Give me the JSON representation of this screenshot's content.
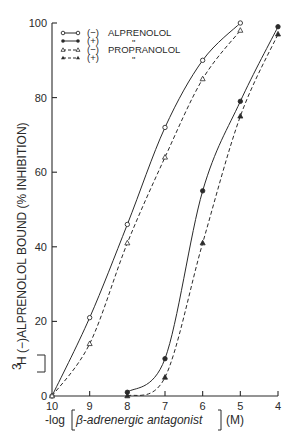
{
  "chart_data": {
    "type": "line",
    "title": "",
    "xlabel": "-log[β-adrenergic antagonist] (M)",
    "ylabel": "[3H](-)ALPRENOLOL BOUND (% INHIBITION)",
    "x_ticks": [
      10,
      9,
      8,
      7,
      6,
      5,
      4
    ],
    "y_ticks": [
      0,
      20,
      40,
      60,
      80,
      100
    ],
    "xlim": [
      10,
      4
    ],
    "ylim": [
      0,
      100
    ],
    "grid": false,
    "legend_position": "top-left",
    "series": [
      {
        "name": "(-) ALPRENOLOL",
        "marker": "open-circle",
        "line": "solid",
        "x": [
          10,
          9,
          8,
          7,
          6,
          5
        ],
        "y": [
          0,
          21,
          46,
          72,
          90,
          100
        ]
      },
      {
        "name": "(+) ALPRENOLOL",
        "marker": "filled-circle",
        "line": "solid",
        "x": [
          8,
          7,
          6,
          5,
          4
        ],
        "y": [
          1,
          10,
          55,
          79,
          99
        ]
      },
      {
        "name": "(-) PROPRANOLOL",
        "marker": "open-triangle",
        "line": "dashed",
        "x": [
          10,
          9,
          8,
          7,
          6,
          5
        ],
        "y": [
          0,
          14,
          41,
          64,
          85,
          98
        ]
      },
      {
        "name": "(+) PROPRANOLOL",
        "marker": "filled-triangle",
        "line": "dashed",
        "x": [
          8,
          7,
          6,
          5,
          4
        ],
        "y": [
          0,
          5,
          41,
          75,
          97
        ]
      }
    ]
  },
  "legend": {
    "items": [
      {
        "sign": "(−)",
        "drug": "ALPRENOLOL"
      },
      {
        "sign": "(+)",
        "drug": "\""
      },
      {
        "sign": "(−)",
        "drug": "PROPRANOLOL"
      },
      {
        "sign": "(+)",
        "drug": "\""
      }
    ]
  },
  "axes": {
    "x_tick_labels": [
      "10",
      "9",
      "8",
      "7",
      "6",
      "5",
      "4"
    ],
    "y_tick_labels": [
      "0",
      "20",
      "40",
      "60",
      "80",
      "100"
    ],
    "xlabel_prefix": "-log",
    "xlabel_inner": "β-adrenergic antagonist",
    "xlabel_unit": "(M)",
    "ylabel_iso": "3",
    "ylabel_elem": "H",
    "ylabel_rest": "(−)ALPRENOLOL BOUND (% INHIBITION)"
  }
}
